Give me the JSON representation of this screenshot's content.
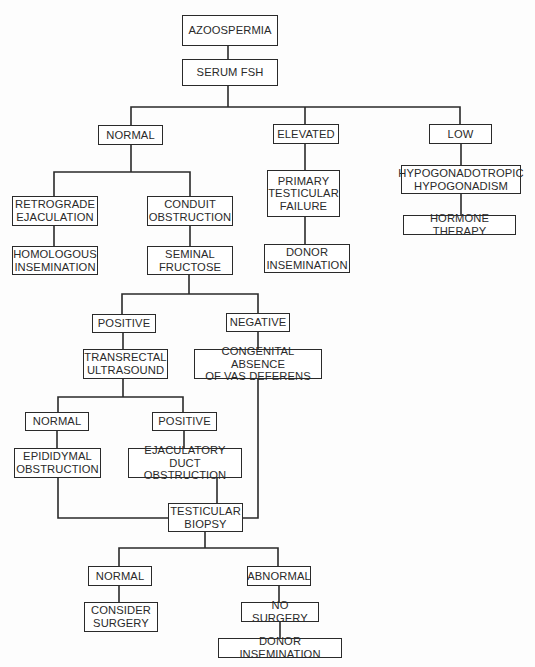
{
  "diagram": {
    "title": "AZOOSPERMIA",
    "colors": {
      "line": "#2a2a2a",
      "box_border": "#2a2a2a",
      "text": "#2a2a2a",
      "background": "#ffffff"
    },
    "nodes": [
      {
        "id": "azoospermia",
        "label": "AZOOSPERMIA",
        "x": 182,
        "y": 15,
        "w": 96,
        "h": 31
      },
      {
        "id": "serum-fsh",
        "label": "SERUM FSH",
        "x": 182,
        "y": 59,
        "w": 96,
        "h": 27
      },
      {
        "id": "fsh-normal",
        "label": "NORMAL",
        "x": 98,
        "y": 125,
        "w": 65,
        "h": 20
      },
      {
        "id": "fsh-elevated",
        "label": "ELEVATED",
        "x": 273,
        "y": 124,
        "w": 66,
        "h": 20
      },
      {
        "id": "fsh-low",
        "label": "LOW",
        "x": 429,
        "y": 124,
        "w": 63,
        "h": 20
      },
      {
        "id": "retrograde-ejaculation",
        "label": "RETROGRADE\nEJACULATION",
        "x": 12,
        "y": 196,
        "w": 86,
        "h": 30
      },
      {
        "id": "conduit-obstruction",
        "label": "CONDUIT\nOBSTRUCTION",
        "x": 147,
        "y": 196,
        "w": 86,
        "h": 30
      },
      {
        "id": "primary-testicular-failure",
        "label": "PRIMARY\nTESTICULAR\nFAILURE",
        "x": 267,
        "y": 170,
        "w": 73,
        "h": 47
      },
      {
        "id": "hypogonadotropic-hypogonadism",
        "label": "HYPOGONADOTROPIC\nHYPOGONADISM",
        "x": 401,
        "y": 165,
        "w": 120,
        "h": 29
      },
      {
        "id": "homologous-insemination",
        "label": "HOMOLOGOUS\nINSEMINATION",
        "x": 12,
        "y": 246,
        "w": 86,
        "h": 29
      },
      {
        "id": "seminal-fructose",
        "label": "SEMINAL\nFRUCTOSE",
        "x": 147,
        "y": 246,
        "w": 86,
        "h": 29
      },
      {
        "id": "donor-insemination-1",
        "label": "DONOR\nINSEMINATION",
        "x": 264,
        "y": 244,
        "w": 86,
        "h": 29
      },
      {
        "id": "hormone-therapy",
        "label": "HORMONE THERAPY",
        "x": 403,
        "y": 215,
        "w": 113,
        "h": 20
      },
      {
        "id": "fructose-positive",
        "label": "POSITIVE",
        "x": 92,
        "y": 314,
        "w": 64,
        "h": 19
      },
      {
        "id": "fructose-negative",
        "label": "NEGATIVE",
        "x": 226,
        "y": 313,
        "w": 64,
        "h": 19
      },
      {
        "id": "transrectal-ultrasound",
        "label": "TRANSRECTAL\nULTRASOUND",
        "x": 83,
        "y": 349,
        "w": 85,
        "h": 30
      },
      {
        "id": "congenital-absence-vas",
        "label": "CONGENITAL ABSENCE\nOF VAS DEFERENS",
        "x": 194,
        "y": 349,
        "w": 128,
        "h": 30
      },
      {
        "id": "tru-normal",
        "label": "NORMAL",
        "x": 25,
        "y": 412,
        "w": 64,
        "h": 19
      },
      {
        "id": "tru-positive",
        "label": "POSITIVE",
        "x": 152,
        "y": 412,
        "w": 65,
        "h": 19
      },
      {
        "id": "epididymal-obstruction",
        "label": "EPIDIDYMAL\nOBSTRUCTION",
        "x": 14,
        "y": 448,
        "w": 87,
        "h": 30
      },
      {
        "id": "ejaculatory-duct-obstruction",
        "label": "EJACULATORY DUCT\nOBSTRUCTION",
        "x": 128,
        "y": 448,
        "w": 114,
        "h": 30
      },
      {
        "id": "testicular-biopsy",
        "label": "TESTICULAR\nBIOPSY",
        "x": 168,
        "y": 503,
        "w": 75,
        "h": 29
      },
      {
        "id": "biopsy-normal",
        "label": "NORMAL",
        "x": 88,
        "y": 566,
        "w": 64,
        "h": 20
      },
      {
        "id": "biopsy-abnormal",
        "label": "ABNORMAL",
        "x": 247,
        "y": 566,
        "w": 64,
        "h": 20
      },
      {
        "id": "consider-surgery",
        "label": "CONSIDER\nSURGERY",
        "x": 84,
        "y": 602,
        "w": 74,
        "h": 30
      },
      {
        "id": "no-surgery",
        "label": "NO SURGERY",
        "x": 241,
        "y": 602,
        "w": 78,
        "h": 20
      },
      {
        "id": "donor-insemination-2",
        "label": "DONOR INSEMINATION",
        "x": 218,
        "y": 638,
        "w": 124,
        "h": 20
      }
    ],
    "edges": [
      {
        "from": "azoospermia",
        "to": "serum-fsh"
      },
      {
        "from": "serum-fsh",
        "to": [
          "fsh-normal",
          "fsh-elevated",
          "fsh-low"
        ]
      },
      {
        "from": "fsh-normal",
        "to": [
          "retrograde-ejaculation",
          "conduit-obstruction"
        ]
      },
      {
        "from": "fsh-elevated",
        "to": "primary-testicular-failure"
      },
      {
        "from": "fsh-low",
        "to": "hypogonadotropic-hypogonadism"
      },
      {
        "from": "retrograde-ejaculation",
        "to": "homologous-insemination"
      },
      {
        "from": "conduit-obstruction",
        "to": "seminal-fructose"
      },
      {
        "from": "primary-testicular-failure",
        "to": "donor-insemination-1"
      },
      {
        "from": "hypogonadotropic-hypogonadism",
        "to": "hormone-therapy"
      },
      {
        "from": "seminal-fructose",
        "to": [
          "fructose-positive",
          "fructose-negative"
        ]
      },
      {
        "from": "fructose-positive",
        "to": "transrectal-ultrasound"
      },
      {
        "from": "fructose-negative",
        "to": "congenital-absence-vas"
      },
      {
        "from": "transrectal-ultrasound",
        "to": [
          "tru-normal",
          "tru-positive"
        ]
      },
      {
        "from": "tru-normal",
        "to": "epididymal-obstruction"
      },
      {
        "from": "tru-positive",
        "to": "ejaculatory-duct-obstruction"
      },
      {
        "from": [
          "epididymal-obstruction",
          "ejaculatory-duct-obstruction",
          "congenital-absence-vas"
        ],
        "to": "testicular-biopsy"
      },
      {
        "from": "testicular-biopsy",
        "to": [
          "biopsy-normal",
          "biopsy-abnormal"
        ]
      },
      {
        "from": "biopsy-normal",
        "to": "consider-surgery"
      },
      {
        "from": "biopsy-abnormal",
        "to": "no-surgery"
      },
      {
        "from": "no-surgery",
        "to": "donor-insemination-2"
      }
    ]
  },
  "connector_paths": [
    "M228 46 V59",
    "M228 86 V107 M131 107 H460 M131 107 V125 M305 107 V124 M460 107 V124",
    "M131 145 V172 M54 172 H190 M54 172 V196 M190 172 V196",
    "M305 144 V170",
    "M461 144 V165",
    "M54 226 V246",
    "M190 226 V246",
    "M305 217 V244",
    "M461 194 V215",
    "M189 275 V294 M122 294 H258 M122 294 V314 M258 294 V313",
    "M123 333 V349",
    "M258 332 V349",
    "M123 379 V397 M58 397 H183 M58 397 V412 M183 397 V412",
    "M57 431 V448",
    "M184 431 V448",
    "M58 478 V518 H168",
    "M217 478 V503",
    "M258 379 V518 H243",
    "M205 532 V548 M119 548 H278 M119 548 V566 M278 548 V566",
    "M119 586 V602",
    "M279 586 V602",
    "M280 622 V638"
  ]
}
